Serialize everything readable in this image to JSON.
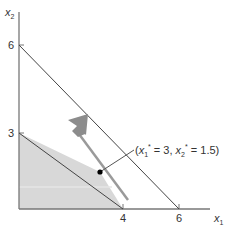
{
  "diagram": {
    "type": "linear-programming-graphical-solution",
    "axes": {
      "x_label": "x",
      "x_label_sub": "1",
      "y_label": "x",
      "y_label_sub": "2",
      "x_ticks": [
        "4",
        "6"
      ],
      "y_ticks": [
        "3",
        "6"
      ]
    },
    "constraints": [
      {
        "name": "constraint-1",
        "from": [
          0,
          6
        ],
        "to": [
          6,
          0
        ]
      },
      {
        "name": "constraint-2",
        "from": [
          0,
          3
        ],
        "to": [
          4,
          0
        ]
      }
    ],
    "feasible_region": {
      "vertices": [
        [
          0,
          0
        ],
        [
          0,
          3
        ],
        [
          3,
          1.5
        ],
        [
          4,
          0
        ]
      ]
    },
    "optimal_point": {
      "x1": 3,
      "x2": 1.5,
      "label_open": "(",
      "label_x": "x",
      "label_x_sub": "1",
      "label_x_sup": "*",
      "label_x_eq": " = 3, ",
      "label_y": "x",
      "label_y_sub": "2",
      "label_y_sup": "*",
      "label_y_eq": " = 1.5)"
    },
    "objective_arrow": "gradient-direction-arrow",
    "colors": {
      "axis": "#777777",
      "line": "#444444",
      "region": "#d8d8d8",
      "objective_line": "#9a9a9a",
      "arrow": "#8c8c8c",
      "point": "#000000"
    }
  }
}
